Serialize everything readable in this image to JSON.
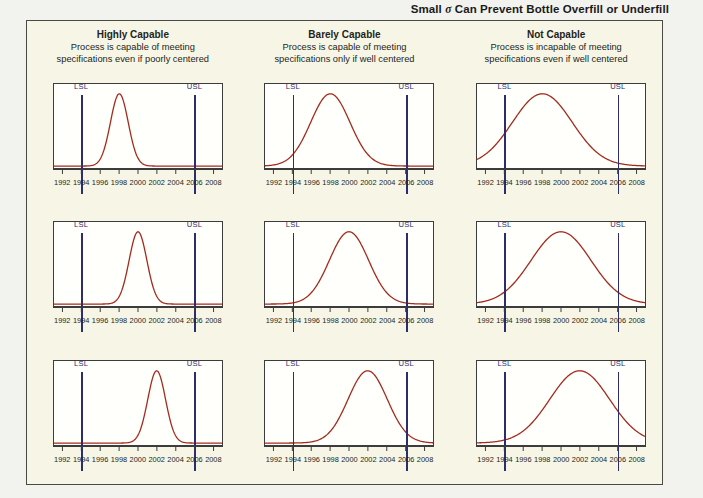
{
  "figure": {
    "title_before": "Small ",
    "title_sigma": "σ",
    "title_after": " Can Prevent Bottle Overfill or Underfill",
    "title_full": "Small σ Can Prevent Bottle Overfill or Underfill",
    "panel_background": "#f7f6e6",
    "page_background": "#f2f2ee"
  },
  "columns": [
    {
      "title": "Highly Capable",
      "subtitle_line1": "Process is capable of meeting",
      "subtitle_line2": "specifications even if poorly centered"
    },
    {
      "title": "Barely Capable",
      "subtitle_line1": "Process is capable of meeting",
      "subtitle_line2": "specifications only if well centered"
    },
    {
      "title": "Not Capable",
      "subtitle_line1": "Process is incapable of meeting",
      "subtitle_line2": "specifications even if well centered"
    }
  ],
  "limits": {
    "lsl_label": "LSL",
    "usl_label": "USL",
    "lsl_value": 1994,
    "usl_value": 2006,
    "line_color": "#2b2d6e"
  },
  "axis": {
    "ticks": [
      1992,
      1994,
      1996,
      1998,
      2000,
      2002,
      2004,
      2006,
      2008
    ],
    "tick_labels": [
      "1992",
      "1994",
      "1996",
      "1998",
      "2000",
      "2002",
      "2004",
      "2006",
      "2008"
    ],
    "min": 1991,
    "max": 2009
  },
  "curve_color": "#a52a1e",
  "chart_data": {
    "type": "line",
    "title": "Small σ Can Prevent Bottle Overfill or Underfill",
    "xlabel": "",
    "ylabel": "",
    "xlim": [
      1991,
      2009
    ],
    "grid": false,
    "legend": "none",
    "panels": [
      {
        "row": 1,
        "col": 1,
        "capability": "Highly Capable",
        "mean": 1998,
        "sigma": 0.95,
        "peak_rel": 1.0
      },
      {
        "row": 1,
        "col": 2,
        "capability": "Barely Capable",
        "mean": 1998,
        "sigma": 2.1,
        "peak_rel": 1.0
      },
      {
        "row": 1,
        "col": 3,
        "capability": "Not Capable",
        "mean": 1998,
        "sigma": 3.2,
        "peak_rel": 1.0
      },
      {
        "row": 2,
        "col": 1,
        "capability": "Highly Capable",
        "mean": 2000,
        "sigma": 0.95,
        "peak_rel": 1.0
      },
      {
        "row": 2,
        "col": 2,
        "capability": "Barely Capable",
        "mean": 2000,
        "sigma": 2.1,
        "peak_rel": 1.0
      },
      {
        "row": 2,
        "col": 3,
        "capability": "Not Capable",
        "mean": 2000,
        "sigma": 3.2,
        "peak_rel": 1.0
      },
      {
        "row": 3,
        "col": 1,
        "capability": "Highly Capable",
        "mean": 2002,
        "sigma": 0.95,
        "peak_rel": 1.0
      },
      {
        "row": 3,
        "col": 2,
        "capability": "Barely Capable",
        "mean": 2002,
        "sigma": 2.1,
        "peak_rel": 1.0
      },
      {
        "row": 3,
        "col": 3,
        "capability": "Not Capable",
        "mean": 2002,
        "sigma": 3.2,
        "peak_rel": 1.0
      }
    ]
  }
}
